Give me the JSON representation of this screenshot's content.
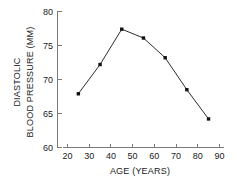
{
  "chart_data": {
    "type": "line",
    "title": "",
    "xlabel": "AGE (YEARS)",
    "ylabel": "DIASTOLIC BLOOD PRESSURE (MM)",
    "ylabel_lines": [
      "DIASTOLIC",
      "BLOOD PRESSURE (MM)"
    ],
    "x": [
      25,
      35,
      45,
      55,
      65,
      75,
      85
    ],
    "values": [
      67.9,
      72.2,
      77.4,
      76.1,
      73.2,
      68.5,
      64.2
    ],
    "series": [
      {
        "name": "Diastolic blood pressure",
        "values": [
          67.9,
          72.2,
          77.4,
          76.1,
          73.2,
          68.5,
          64.2
        ]
      }
    ],
    "xlim": [
      20,
      90
    ],
    "ylim": [
      60,
      80
    ],
    "xticks": [
      20,
      30,
      40,
      50,
      60,
      70,
      80,
      90
    ],
    "yticks": [
      60,
      65,
      70,
      75,
      80
    ],
    "xtick_labels": [
      "20",
      "30",
      "40",
      "50",
      "60",
      "70",
      "80",
      "90"
    ],
    "ytick_labels": [
      "60",
      "65",
      "70",
      "75",
      "80"
    ],
    "grid": false,
    "legend": false,
    "marker": "square",
    "line_color": "#2b2b2b",
    "marker_color": "#111111",
    "axis_color": "#7a7a7a",
    "background_color": "#ffffff"
  }
}
